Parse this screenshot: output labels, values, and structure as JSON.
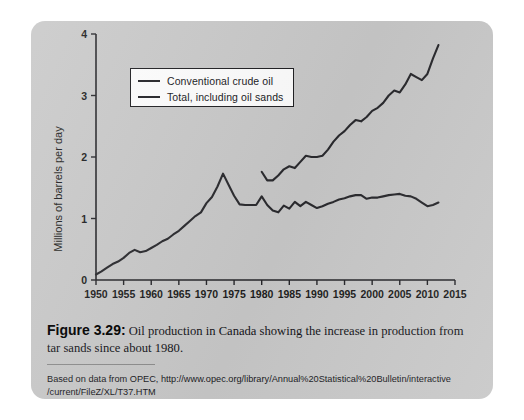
{
  "figure": {
    "caption_label": "Figure 3.29:",
    "caption_text": " Oil production in Canada showing the increase in production from tar sands since about 1980.",
    "source_line_1": "Based on data from OPEC, http://www.opec.org/library/Annual%20Statistical%20Bulletin/interactive",
    "source_line_2": "/current/FileZ/XL/T37.HTM",
    "card_color": "#c9c9c9",
    "ink_color": "#26262a"
  },
  "chart_data": {
    "type": "line",
    "title": "",
    "xlabel": "",
    "ylabel": "Millions of barrels per day",
    "xlim": [
      1950,
      2015
    ],
    "ylim": [
      0,
      4
    ],
    "xticks": [
      1950,
      1955,
      1960,
      1965,
      1970,
      1975,
      1980,
      1985,
      1990,
      1995,
      2000,
      2005,
      2010,
      2015
    ],
    "yticks": [
      0,
      1,
      2,
      3,
      4
    ],
    "grid": false,
    "legend_position": "upper-left",
    "series": [
      {
        "name": "Conventional crude oil",
        "color": "#2a2a2e",
        "x": [
          1950,
          1951,
          1952,
          1953,
          1954,
          1955,
          1956,
          1957,
          1958,
          1959,
          1960,
          1961,
          1962,
          1963,
          1964,
          1965,
          1966,
          1967,
          1968,
          1969,
          1970,
          1971,
          1972,
          1973,
          1974,
          1975,
          1976,
          1977,
          1978,
          1979,
          1980,
          1981,
          1982,
          1983,
          1984,
          1985,
          1986,
          1987,
          1988,
          1989,
          1990,
          1991,
          1992,
          1993,
          1994,
          1995,
          1996,
          1997,
          1998,
          1999,
          2000,
          2001,
          2002,
          2003,
          2004,
          2005,
          2006,
          2007,
          2008,
          2009,
          2010,
          2011,
          2012
        ],
        "y": [
          0.09,
          0.14,
          0.2,
          0.26,
          0.3,
          0.36,
          0.44,
          0.49,
          0.45,
          0.47,
          0.52,
          0.57,
          0.63,
          0.67,
          0.74,
          0.8,
          0.88,
          0.96,
          1.04,
          1.1,
          1.25,
          1.35,
          1.52,
          1.73,
          1.55,
          1.37,
          1.23,
          1.22,
          1.22,
          1.22,
          1.36,
          1.22,
          1.13,
          1.1,
          1.21,
          1.16,
          1.27,
          1.2,
          1.27,
          1.22,
          1.17,
          1.2,
          1.24,
          1.27,
          1.31,
          1.33,
          1.36,
          1.38,
          1.38,
          1.32,
          1.34,
          1.34,
          1.36,
          1.38,
          1.39,
          1.4,
          1.37,
          1.36,
          1.32,
          1.26,
          1.2,
          1.22,
          1.26
        ]
      },
      {
        "name": "Total, including oil sands",
        "color": "#2a2a2e",
        "x": [
          1980,
          1981,
          1982,
          1983,
          1984,
          1985,
          1986,
          1987,
          1988,
          1989,
          1990,
          1991,
          1992,
          1993,
          1994,
          1995,
          1996,
          1997,
          1998,
          1999,
          2000,
          2001,
          2002,
          2003,
          2004,
          2005,
          2006,
          2007,
          2008,
          2009,
          2010,
          2011,
          2012
        ],
        "y": [
          1.76,
          1.62,
          1.62,
          1.7,
          1.8,
          1.85,
          1.82,
          1.92,
          2.02,
          2.0,
          2.0,
          2.02,
          2.12,
          2.25,
          2.35,
          2.42,
          2.52,
          2.6,
          2.58,
          2.65,
          2.75,
          2.8,
          2.88,
          3.0,
          3.08,
          3.05,
          3.18,
          3.35,
          3.3,
          3.25,
          3.35,
          3.6,
          3.82
        ]
      }
    ]
  }
}
